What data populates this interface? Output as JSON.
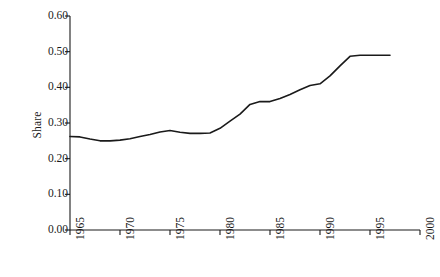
{
  "chart_data": {
    "type": "line",
    "title": "",
    "xlabel": "",
    "ylabel": "Share",
    "xlim": [
      1965,
      2000
    ],
    "ylim": [
      0.0,
      0.6
    ],
    "grid": false,
    "legend": null,
    "x_ticks": [
      1965,
      1970,
      1975,
      1980,
      1985,
      1990,
      1995,
      2000
    ],
    "x_tick_labels": [
      "1965",
      "1970",
      "1975",
      "1980",
      "1985",
      "1990",
      "1995",
      "2000"
    ],
    "y_ticks": [
      0.0,
      0.1,
      0.2,
      0.3,
      0.4,
      0.5,
      0.6
    ],
    "y_tick_labels": [
      "0.00",
      "0.10",
      "0.20",
      "0.30",
      "0.40",
      "0.50",
      "0.60"
    ],
    "line_color": "#1a1a1a",
    "line_width": 1.6,
    "series": [
      {
        "name": "Share",
        "x": [
          1965,
          1966,
          1967,
          1968,
          1969,
          1970,
          1971,
          1972,
          1973,
          1974,
          1975,
          1976,
          1977,
          1978,
          1979,
          1980,
          1981,
          1982,
          1983,
          1984,
          1985,
          1986,
          1987,
          1988,
          1989,
          1990,
          1991,
          1992,
          1993,
          1994,
          1995,
          1996,
          1997
        ],
        "values": [
          0.262,
          0.261,
          0.255,
          0.25,
          0.25,
          0.252,
          0.256,
          0.262,
          0.268,
          0.275,
          0.279,
          0.274,
          0.271,
          0.271,
          0.272,
          0.285,
          0.305,
          0.325,
          0.352,
          0.36,
          0.36,
          0.369,
          0.38,
          0.393,
          0.405,
          0.41,
          0.432,
          0.46,
          0.487,
          0.49,
          0.49,
          0.49,
          0.49
        ]
      }
    ]
  },
  "axes": {
    "y_axis_title": "Share"
  }
}
